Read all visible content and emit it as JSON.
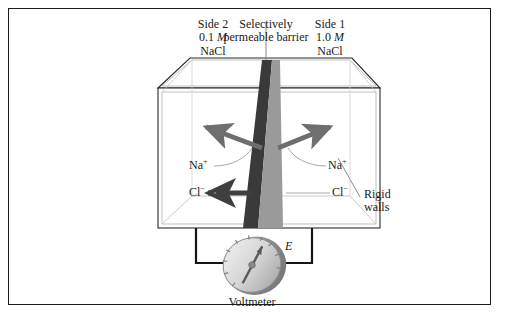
{
  "figure": {
    "kind": "electrochemical-cell-diagram"
  },
  "labels": {
    "side2": {
      "title": "Side 2",
      "conc_value": "0.1",
      "conc_unit": "M",
      "salt": "NaCl"
    },
    "side1": {
      "title": "Side 1",
      "conc_value": "1.0",
      "conc_unit": "M",
      "salt": "NaCl"
    },
    "barrier": {
      "line1": "Selectively",
      "line2": "permeable barrier"
    },
    "rigid_walls": {
      "line1": "Rigid",
      "line2": "walls"
    },
    "voltmeter": "Voltmeter",
    "emf_symbol": "E",
    "ions": {
      "sodium_left": "Na",
      "sodium_left_charge": "+",
      "sodium_right": "Na",
      "sodium_right_charge": "+",
      "chloride_left": "Cl",
      "chloride_left_charge": "−",
      "chloride_right": "Cl",
      "chloride_right_charge": "−"
    }
  },
  "colors": {
    "frame": "#1b1b1b",
    "box_edge": "#2a2a2a",
    "box_inner_line": "#b9b9b9",
    "barrier_dark": "#3a3a3a",
    "barrier_light": "#9a9a9a",
    "arrow_gray": "#6e6e6e",
    "arrow_dark": "#3f3f3f",
    "leader": "#a8a8a8",
    "wire": "#161616",
    "gauge_face": "#d8d8d8",
    "gauge_rim": "#8d8d8d",
    "needle": "#5a5a5a",
    "text": "#1a1a1a"
  }
}
